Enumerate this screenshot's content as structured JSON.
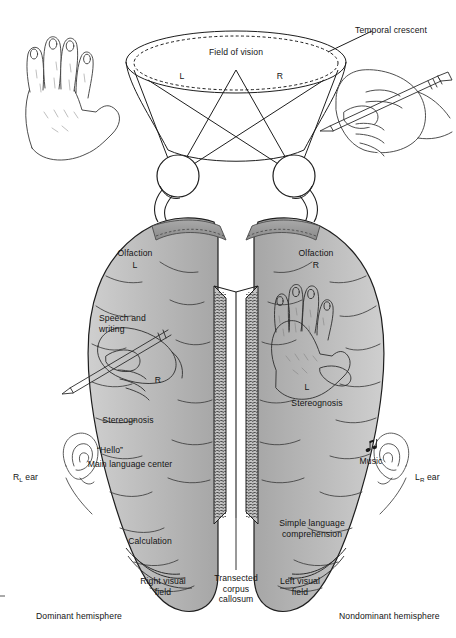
{
  "figure": {
    "type": "anatomical-diagram",
    "palette": {
      "brain_fill": "#b9b9b9",
      "brain_fill_light": "#c8c8c8",
      "brain_shadow": "#8f8f8f",
      "olfactory_tract": "#9a9a9a",
      "outline": "#1e1e1e",
      "background": "#ffffff",
      "text": "#141414"
    }
  },
  "vision": {
    "field_label": "Field of vision",
    "left_half_label": "L",
    "right_half_label": "R",
    "temporal_crescent_label": "Temporal crescent"
  },
  "left_hemisphere": {
    "olfaction_label": "Olfaction",
    "olfaction_side": "L",
    "speech_writing_label": "Speech and\nwriting",
    "hand_side_label": "R",
    "stereognosis_label": "Stereognosis",
    "hello_label": "“Hello”",
    "main_language_label": "Main language center",
    "ear_label_main": "R",
    "ear_label_sub": "L",
    "ear_label_tail": "ear",
    "calculation_label": "Calculation",
    "visual_field_label": "Right visual\nfield",
    "hemisphere_label": "Dominant hemisphere"
  },
  "right_hemisphere": {
    "olfaction_label": "Olfaction",
    "olfaction_side": "R",
    "hand_side_label": "L",
    "stereognosis_label": "Stereognosis",
    "music_label": "Music",
    "music_icon": "music-note-icon",
    "ear_label_main": "L",
    "ear_label_sub": "R",
    "ear_label_tail": "ear",
    "simple_language_label": "Simple language\ncomprehension",
    "visual_field_label": "Left visual\nfield",
    "hemisphere_label": "Nondominant hemisphere"
  },
  "midline": {
    "corpus_callosum_label": "Transected\ncorpus\ncallosum"
  }
}
